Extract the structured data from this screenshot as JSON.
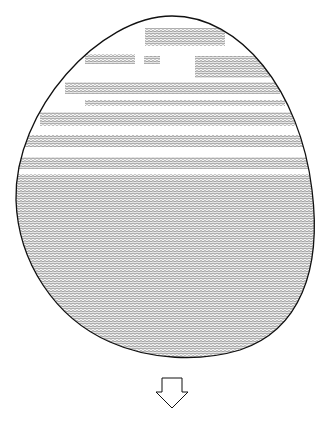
{
  "figure": {
    "stroke_color": "#111111",
    "hatch_color": "#333333",
    "background": "#ffffff"
  },
  "egg": {
    "path": "M172,16 C240,16 300,90 312,190 C322,270 300,330 240,350 C200,362 150,360 110,342 C55,318 18,262 16,200 C14,110 100,16 172,16 Z"
  },
  "bands": [
    {
      "y": 28,
      "h": 18,
      "x1": 145,
      "x2": 225
    },
    {
      "y": 54,
      "h": 10,
      "x1": 85,
      "x2": 135
    },
    {
      "y": 56,
      "h": 8,
      "x1": 144,
      "x2": 160
    },
    {
      "y": 56,
      "h": 22,
      "x1": 195,
      "x2": 270
    },
    {
      "y": 82,
      "h": 12,
      "x1": 65,
      "x2": 280
    },
    {
      "y": 100,
      "h": 6,
      "x1": 85,
      "x2": 285
    },
    {
      "y": 112,
      "h": 14,
      "x1": 40,
      "x2": 295
    },
    {
      "y": 135,
      "h": 12,
      "x1": 25,
      "x2": 305
    },
    {
      "y": 157,
      "h": 12,
      "x1": 18,
      "x2": 310
    },
    {
      "y": 174,
      "h": 190,
      "x1": 0,
      "x2": 323
    }
  ],
  "arrow": {
    "direction": "down",
    "points": "162,378 182,378 182,392 188,392 172,408 156,392 162,392"
  }
}
